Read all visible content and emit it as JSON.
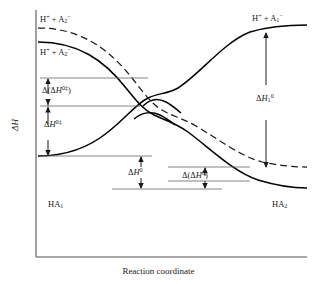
{
  "figure": {
    "type": "reaction-coordinate-energy-diagram",
    "axes": {
      "y_label": "ΔH",
      "x_label": "Reaction coordinate",
      "frame_color": "#555555"
    },
    "labels": {
      "top_left_dashed": {
        "prefix": "H",
        "prefix_sup": "+",
        "mid": " + A",
        "sub": "2",
        "sup": "−"
      },
      "top_left_solid": {
        "prefix": "H",
        "prefix_sup": "+",
        "mid": " + A",
        "sub": "2",
        "sup": "−"
      },
      "top_right": {
        "prefix": "H",
        "prefix_sup": "+",
        "mid": " + A",
        "sub": "1",
        "sup": "−"
      },
      "bottom_left": {
        "text": "HA",
        "sub": "1"
      },
      "bottom_right": {
        "text": "HA",
        "sub": "2"
      },
      "delta_delta_h_act": {
        "lead": "Δ(Δ",
        "italic": "H",
        "sup": "0‡",
        "tail": ")"
      },
      "delta_h_act": {
        "lead": "Δ",
        "italic": "H",
        "sup": "0‡"
      },
      "delta_h_rxn": {
        "lead": "Δ",
        "italic": "H",
        "sup": "0"
      },
      "delta_delta_h_rxn": {
        "lead": "Δ(Δ",
        "italic": "H",
        "sup": "0",
        "tail": ")"
      },
      "delta_h_1": {
        "lead": "Δ",
        "italic": "H",
        "sub": "1",
        "sup": "0"
      }
    },
    "curves": {
      "descending_solid": "H+ + A2- reactant state falling to HA2 product",
      "descending_dashed": "perturbed H+ + A2- state falling to lower HA2 product",
      "ascending_solid": "HA1 rising to H+ + A1-"
    },
    "colors": {
      "line": "#000000",
      "frame": "#555555",
      "annotation_rule": "#666666",
      "text": "#1a1a1a"
    }
  }
}
